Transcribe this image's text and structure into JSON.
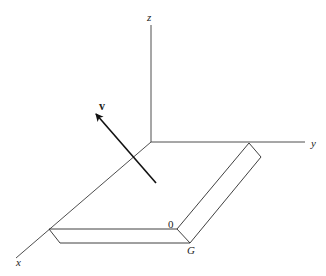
{
  "diagram": {
    "type": "3d-coordinate-system",
    "axes": {
      "x": {
        "label": "x"
      },
      "y": {
        "label": "y"
      },
      "z": {
        "label": "z"
      }
    },
    "vector": {
      "label": "v"
    },
    "plate": {
      "corner_labels": {
        "inner": "0",
        "outer": "G"
      }
    },
    "colors": {
      "background": "#ffffff",
      "lines": "#2a2a2a",
      "vector": "#111111"
    }
  }
}
